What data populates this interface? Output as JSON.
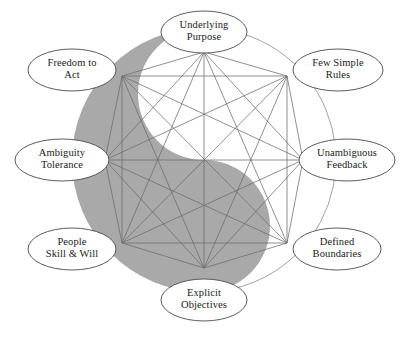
{
  "diagram": {
    "shape_name": "yin-yang",
    "colors": {
      "background": "#ffffff",
      "yin_gray": "#a9a9a9",
      "yang_white": "#ffffff",
      "line": "#6b6b6b",
      "node_stroke": "#4a4a4a",
      "node_fill": "#ffffff",
      "text": "#1a1a1a",
      "arc_stroke": "#8a8a8a"
    },
    "geometry": {
      "center_x": 204,
      "center_y": 160,
      "circle_radius": 132,
      "node_radius": 108,
      "eye_radius": 13
    },
    "nodes": [
      {
        "id": "underlying-purpose",
        "lines": [
          "Underlying",
          "Purpose"
        ],
        "angle_deg": 270,
        "cx": 204,
        "cy": 32,
        "rx": 43,
        "ry": 21,
        "vx": 204,
        "vy": 52
      },
      {
        "id": "few-simple-rules",
        "lines": [
          "Few Simple",
          "Rules"
        ],
        "angle_deg": 315,
        "cx": 338,
        "cy": 70,
        "rx": 45,
        "ry": 21,
        "vx": 287,
        "vy": 76
      },
      {
        "id": "unambiguous-feedback",
        "lines": [
          "Unambiguous",
          "Feedback"
        ],
        "angle_deg": 0,
        "cx": 347,
        "cy": 160,
        "rx": 48,
        "ry": 21,
        "vx": 303,
        "vy": 160
      },
      {
        "id": "defined-boundaries",
        "lines": [
          "Defined",
          "Boundaries"
        ],
        "angle_deg": 45,
        "cx": 337,
        "cy": 249,
        "rx": 44,
        "ry": 21,
        "vx": 287,
        "vy": 243
      },
      {
        "id": "explicit-objectives",
        "lines": [
          "Explicit",
          "Objectives"
        ],
        "angle_deg": 90,
        "cx": 204,
        "cy": 300,
        "rx": 43,
        "ry": 21,
        "vx": 204,
        "vy": 268
      },
      {
        "id": "people-skill-will",
        "lines": [
          "People",
          "Skill & Will"
        ],
        "angle_deg": 135,
        "cx": 72,
        "cy": 249,
        "rx": 44,
        "ry": 21,
        "vx": 122,
        "vy": 243
      },
      {
        "id": "ambiguity-tolerance",
        "lines": [
          "Ambiguity",
          "Tolerance"
        ],
        "angle_deg": 180,
        "cx": 62,
        "cy": 160,
        "rx": 47,
        "ry": 21,
        "vx": 105,
        "vy": 160
      },
      {
        "id": "freedom-to-act",
        "lines": [
          "Freedom to",
          "Act"
        ],
        "angle_deg": 225,
        "cx": 72,
        "cy": 70,
        "rx": 44,
        "ry": 21,
        "vx": 122,
        "vy": 76
      }
    ]
  }
}
